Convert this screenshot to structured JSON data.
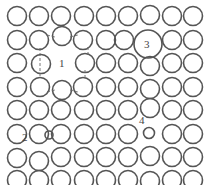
{
  "diagram": {
    "type": "crystal-lattice-point-defects",
    "labels": [
      {
        "id": "1",
        "text": "1",
        "x": 62,
        "y": 67
      },
      {
        "id": "2",
        "text": "2",
        "x": 23,
        "y": 140
      },
      {
        "id": "3",
        "text": "3",
        "x": 148,
        "y": 48
      },
      {
        "id": "4",
        "text": "4",
        "x": 142,
        "y": 123
      }
    ],
    "colors": {
      "stroke": "#555555",
      "background": "#ffffff"
    }
  }
}
